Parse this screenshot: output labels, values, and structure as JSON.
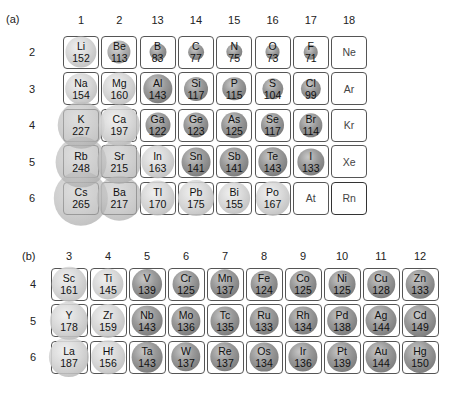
{
  "panel_a": {
    "label": "(a)",
    "group_labels": [
      "1",
      "2",
      "13",
      "14",
      "15",
      "16",
      "17",
      "18"
    ],
    "period_labels": [
      "2",
      "3",
      "4",
      "5",
      "6"
    ],
    "cells": [
      {
        "sym": "Li",
        "r": "152",
        "col": 0,
        "row": 0,
        "type": "metal"
      },
      {
        "sym": "Be",
        "r": "113",
        "col": 1,
        "row": 0,
        "type": "mid"
      },
      {
        "sym": "B",
        "r": "83",
        "col": 2,
        "row": 0,
        "type": "nonmetal"
      },
      {
        "sym": "C",
        "r": "77",
        "col": 3,
        "row": 0,
        "type": "nonmetal"
      },
      {
        "sym": "N",
        "r": "75",
        "col": 4,
        "row": 0,
        "type": "nonmetal"
      },
      {
        "sym": "O",
        "r": "73",
        "col": 5,
        "row": 0,
        "type": "nonmetal"
      },
      {
        "sym": "F",
        "r": "71",
        "col": 6,
        "row": 0,
        "type": "nonmetal"
      },
      {
        "sym": "Ne",
        "r": "",
        "col": 7,
        "row": 0,
        "type": "noble"
      },
      {
        "sym": "Na",
        "r": "154",
        "col": 0,
        "row": 1,
        "type": "metal"
      },
      {
        "sym": "Mg",
        "r": "160",
        "col": 1,
        "row": 1,
        "type": "metal"
      },
      {
        "sym": "Al",
        "r": "143",
        "col": 2,
        "row": 1,
        "type": "nonmetal"
      },
      {
        "sym": "Si",
        "r": "117",
        "col": 3,
        "row": 1,
        "type": "nonmetal"
      },
      {
        "sym": "P",
        "r": "115",
        "col": 4,
        "row": 1,
        "type": "nonmetal"
      },
      {
        "sym": "S",
        "r": "104",
        "col": 5,
        "row": 1,
        "type": "nonmetal"
      },
      {
        "sym": "Cl",
        "r": "99",
        "col": 6,
        "row": 1,
        "type": "nonmetal"
      },
      {
        "sym": "Ar",
        "r": "",
        "col": 7,
        "row": 1,
        "type": "noble"
      },
      {
        "sym": "K",
        "r": "227",
        "col": 0,
        "row": 2,
        "type": "metal"
      },
      {
        "sym": "Ca",
        "r": "197",
        "col": 1,
        "row": 2,
        "type": "metal"
      },
      {
        "sym": "Ga",
        "r": "122",
        "col": 2,
        "row": 2,
        "type": "nonmetal"
      },
      {
        "sym": "Ge",
        "r": "123",
        "col": 3,
        "row": 2,
        "type": "nonmetal"
      },
      {
        "sym": "As",
        "r": "125",
        "col": 4,
        "row": 2,
        "type": "nonmetal"
      },
      {
        "sym": "Se",
        "r": "117",
        "col": 5,
        "row": 2,
        "type": "nonmetal"
      },
      {
        "sym": "Br",
        "r": "114",
        "col": 6,
        "row": 2,
        "type": "nonmetal"
      },
      {
        "sym": "Kr",
        "r": "",
        "col": 7,
        "row": 2,
        "type": "noble"
      },
      {
        "sym": "Rb",
        "r": "248",
        "col": 0,
        "row": 3,
        "type": "metal"
      },
      {
        "sym": "Sr",
        "r": "215",
        "col": 1,
        "row": 3,
        "type": "metal"
      },
      {
        "sym": "In",
        "r": "163",
        "col": 2,
        "row": 3,
        "type": "metal"
      },
      {
        "sym": "Sn",
        "r": "141",
        "col": 3,
        "row": 3,
        "type": "nonmetal"
      },
      {
        "sym": "Sb",
        "r": "141",
        "col": 4,
        "row": 3,
        "type": "nonmetal"
      },
      {
        "sym": "Te",
        "r": "143",
        "col": 5,
        "row": 3,
        "type": "nonmetal"
      },
      {
        "sym": "I",
        "r": "133",
        "col": 6,
        "row": 3,
        "type": "nonmetal"
      },
      {
        "sym": "Xe",
        "r": "",
        "col": 7,
        "row": 3,
        "type": "noble"
      },
      {
        "sym": "Cs",
        "r": "265",
        "col": 0,
        "row": 4,
        "type": "metal"
      },
      {
        "sym": "Ba",
        "r": "217",
        "col": 1,
        "row": 4,
        "type": "metal"
      },
      {
        "sym": "Tl",
        "r": "170",
        "col": 2,
        "row": 4,
        "type": "metal"
      },
      {
        "sym": "Pb",
        "r": "175",
        "col": 3,
        "row": 4,
        "type": "metal"
      },
      {
        "sym": "Bi",
        "r": "155",
        "col": 4,
        "row": 4,
        "type": "metal"
      },
      {
        "sym": "Po",
        "r": "167",
        "col": 5,
        "row": 4,
        "type": "metal"
      },
      {
        "sym": "At",
        "r": "",
        "col": 6,
        "row": 4,
        "type": "empty"
      },
      {
        "sym": "Rn",
        "r": "",
        "col": 7,
        "row": 4,
        "type": "noble"
      }
    ]
  },
  "panel_b": {
    "label": "(b)",
    "group_labels": [
      "3",
      "4",
      "5",
      "6",
      "7",
      "8",
      "9",
      "10",
      "11",
      "12"
    ],
    "period_labels": [
      "4",
      "5",
      "6"
    ],
    "cells": [
      {
        "sym": "Sc",
        "r": "161",
        "col": 0,
        "row": 0,
        "type": "metal"
      },
      {
        "sym": "Ti",
        "r": "145",
        "col": 1,
        "row": 0,
        "type": "metal"
      },
      {
        "sym": "V",
        "r": "139",
        "col": 2,
        "row": 0,
        "type": "nonmetal"
      },
      {
        "sym": "Cr",
        "r": "125",
        "col": 3,
        "row": 0,
        "type": "nonmetal"
      },
      {
        "sym": "Mn",
        "r": "137",
        "col": 4,
        "row": 0,
        "type": "nonmetal"
      },
      {
        "sym": "Fe",
        "r": "124",
        "col": 5,
        "row": 0,
        "type": "nonmetal"
      },
      {
        "sym": "Co",
        "r": "125",
        "col": 6,
        "row": 0,
        "type": "nonmetal"
      },
      {
        "sym": "Ni",
        "r": "125",
        "col": 7,
        "row": 0,
        "type": "nonmetal"
      },
      {
        "sym": "Cu",
        "r": "128",
        "col": 8,
        "row": 0,
        "type": "nonmetal"
      },
      {
        "sym": "Zn",
        "r": "133",
        "col": 9,
        "row": 0,
        "type": "nonmetal"
      },
      {
        "sym": "Y",
        "r": "178",
        "col": 0,
        "row": 1,
        "type": "metal"
      },
      {
        "sym": "Zr",
        "r": "159",
        "col": 1,
        "row": 1,
        "type": "metal"
      },
      {
        "sym": "Nb",
        "r": "143",
        "col": 2,
        "row": 1,
        "type": "nonmetal"
      },
      {
        "sym": "Mo",
        "r": "136",
        "col": 3,
        "row": 1,
        "type": "nonmetal"
      },
      {
        "sym": "Tc",
        "r": "135",
        "col": 4,
        "row": 1,
        "type": "nonmetal"
      },
      {
        "sym": "Ru",
        "r": "133",
        "col": 5,
        "row": 1,
        "type": "nonmetal"
      },
      {
        "sym": "Rh",
        "r": "134",
        "col": 6,
        "row": 1,
        "type": "nonmetal"
      },
      {
        "sym": "Pd",
        "r": "138",
        "col": 7,
        "row": 1,
        "type": "nonmetal"
      },
      {
        "sym": "Ag",
        "r": "144",
        "col": 8,
        "row": 1,
        "type": "nonmetal"
      },
      {
        "sym": "Cd",
        "r": "149",
        "col": 9,
        "row": 1,
        "type": "nonmetal"
      },
      {
        "sym": "La",
        "r": "187",
        "col": 0,
        "row": 2,
        "type": "metal"
      },
      {
        "sym": "Hf",
        "r": "156",
        "col": 1,
        "row": 2,
        "type": "metal"
      },
      {
        "sym": "Ta",
        "r": "143",
        "col": 2,
        "row": 2,
        "type": "nonmetal"
      },
      {
        "sym": "W",
        "r": "137",
        "col": 3,
        "row": 2,
        "type": "nonmetal"
      },
      {
        "sym": "Re",
        "r": "137",
        "col": 4,
        "row": 2,
        "type": "nonmetal"
      },
      {
        "sym": "Os",
        "r": "134",
        "col": 5,
        "row": 2,
        "type": "nonmetal"
      },
      {
        "sym": "Ir",
        "r": "136",
        "col": 6,
        "row": 2,
        "type": "nonmetal"
      },
      {
        "sym": "Pt",
        "r": "139",
        "col": 7,
        "row": 2,
        "type": "nonmetal"
      },
      {
        "sym": "Au",
        "r": "144",
        "col": 8,
        "row": 2,
        "type": "nonmetal"
      },
      {
        "sym": "Hg",
        "r": "150",
        "col": 9,
        "row": 2,
        "type": "nonmetal"
      }
    ]
  }
}
